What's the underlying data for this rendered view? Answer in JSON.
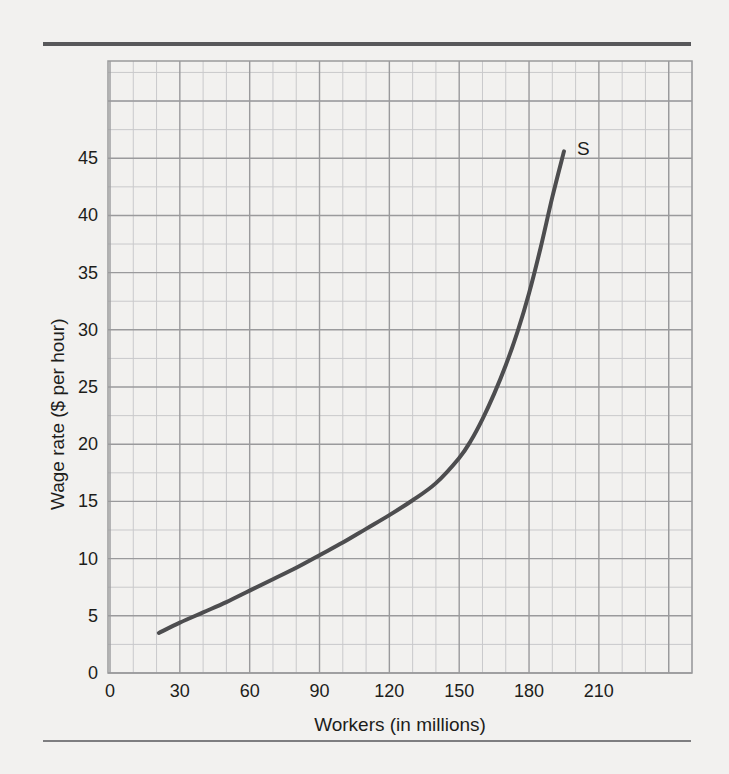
{
  "figure": {
    "background_color": "#f2f1ef",
    "top_rule_color": "#58585a",
    "bottom_rule_color": "#7e7e80"
  },
  "chart_data": {
    "type": "line",
    "title": "",
    "subtitle": "",
    "xlabel": "Workers (in millions)",
    "ylabel": "Wage rate ($ per hour)",
    "xlim": [
      0,
      250
    ],
    "ylim": [
      0,
      53.5
    ],
    "x_ticks": [
      0,
      30,
      60,
      90,
      120,
      150,
      180,
      210
    ],
    "x_tick_labels": [
      "0",
      "30",
      "60",
      "90",
      "120",
      "150",
      "180",
      "210"
    ],
    "y_ticks": [
      0,
      5,
      10,
      15,
      20,
      25,
      30,
      35,
      40,
      45
    ],
    "y_tick_labels": [
      "0",
      "5",
      "10",
      "15",
      "20",
      "25",
      "30",
      "35",
      "40",
      "45"
    ],
    "grid": true,
    "grid_major_color": "#9a9a9c",
    "grid_minor_color": "#c9c9cb",
    "x_minor_step": 10,
    "y_minor_step": 2.5,
    "legend": "none",
    "series": [
      {
        "name": "S",
        "label": "S",
        "label_x": 198,
        "label_y": 45.7,
        "color": "#4d4d4f",
        "line_width": 4,
        "points": [
          [
            21.0,
            3.5
          ],
          [
            30.0,
            4.4
          ],
          [
            40.0,
            5.3
          ],
          [
            50.0,
            6.2
          ],
          [
            60.0,
            7.2
          ],
          [
            70.0,
            8.2
          ],
          [
            80.0,
            9.2
          ],
          [
            90.0,
            10.3
          ],
          [
            100.0,
            11.4
          ],
          [
            110.0,
            12.6
          ],
          [
            120.0,
            13.8
          ],
          [
            130.0,
            15.1
          ],
          [
            140.0,
            16.6
          ],
          [
            150.0,
            18.8
          ],
          [
            155.0,
            20.3
          ],
          [
            160.0,
            22.2
          ],
          [
            165.0,
            24.4
          ],
          [
            170.0,
            26.9
          ],
          [
            175.0,
            29.8
          ],
          [
            180.0,
            33.2
          ],
          [
            185.0,
            37.2
          ],
          [
            190.0,
            41.6
          ],
          [
            195.0,
            45.6
          ]
        ]
      }
    ],
    "annotations": [
      {
        "text": "S",
        "name": "supply-curve-label"
      }
    ]
  }
}
